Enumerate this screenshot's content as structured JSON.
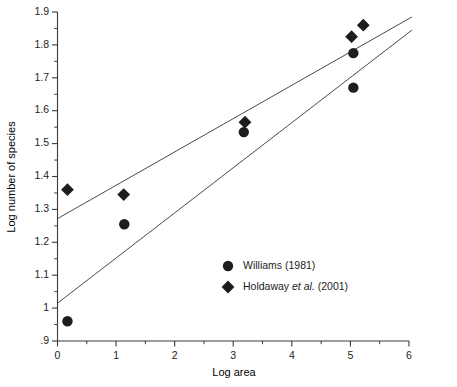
{
  "chart_data": {
    "type": "scatter",
    "title": "",
    "xlabel": "Log area",
    "ylabel": "Log number of species",
    "xlim": [
      0,
      6
    ],
    "ylim": [
      0.9,
      1.9
    ],
    "grid": false,
    "x_ticks": [
      "0",
      "1",
      "2",
      "3",
      "4",
      "5",
      "6"
    ],
    "x_tick_values": [
      0,
      1,
      2,
      3,
      4,
      5,
      6
    ],
    "x_minor_step": 0.5,
    "y_ticks": [
      ".9",
      "1",
      "1.1",
      "1.2",
      "1.3",
      "1.4",
      "1.5",
      "1.6",
      "1.7",
      "1.8",
      "1.9"
    ],
    "y_tick_values": [
      0.9,
      1.0,
      1.1,
      1.2,
      1.3,
      1.4,
      1.5,
      1.6,
      1.7,
      1.8,
      1.9
    ],
    "y_minor_step": 0.05,
    "legend_position": "center",
    "series": [
      {
        "name": "Williams (1981)",
        "marker": "circle",
        "color": "#1d1d1d",
        "points": [
          {
            "x": 0.17,
            "y": 0.96
          },
          {
            "x": 1.14,
            "y": 1.255
          },
          {
            "x": 3.18,
            "y": 1.535
          },
          {
            "x": 5.05,
            "y": 1.775
          },
          {
            "x": 5.05,
            "y": 1.67
          }
        ]
      },
      {
        "name": "Holdaway et al. (2001)",
        "marker": "diamond",
        "color": "#1d1d1d",
        "points": [
          {
            "x": 0.17,
            "y": 1.36
          },
          {
            "x": 1.13,
            "y": 1.345
          },
          {
            "x": 3.2,
            "y": 1.565
          },
          {
            "x": 5.02,
            "y": 1.825
          },
          {
            "x": 5.22,
            "y": 1.86
          }
        ]
      }
    ],
    "fit_lines": [
      {
        "name": "holdaway-fit",
        "x_start": 0.0,
        "y_start": 1.272,
        "x_end": 6.05,
        "y_end": 1.885
      },
      {
        "name": "williams-fit",
        "x_start": 0.0,
        "y_start": 1.015,
        "x_end": 6.05,
        "y_end": 1.845
      }
    ]
  },
  "legend": {
    "entries": [
      {
        "marker": "circle",
        "label": "Williams (1981)",
        "plain": "Williams (1981)",
        "italic": "",
        "tail": ""
      },
      {
        "marker": "diamond",
        "label": "Holdaway et al. (2001)",
        "plain": "Holdaway ",
        "italic": "et al.",
        "tail": " (2001)"
      }
    ]
  }
}
